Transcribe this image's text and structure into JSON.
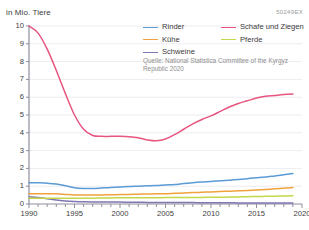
{
  "chart_data": {
    "type": "line",
    "title": "",
    "subtitle": "",
    "unit_label": "in Mio. Tiere",
    "xlabel": "",
    "ylabel": "in Mio. Tiere",
    "xlim": [
      1990,
      2020
    ],
    "ylim": [
      0,
      10
    ],
    "y_ticks": [
      "0",
      "1",
      "2",
      "3",
      "4",
      "5",
      "6",
      "7",
      "8",
      "9",
      "10"
    ],
    "x_ticks": [
      "1990",
      "1995",
      "2000",
      "2005",
      "2010",
      "2015",
      "2020"
    ],
    "x_minor_tick_step": 1,
    "grid": true,
    "legend_position": "top-right",
    "source_id": "50249EX",
    "source_note": "Quelle: National Statistica Committee of the Kyrgyz Republic 2020",
    "x": [
      1990,
      1991,
      1992,
      1993,
      1994,
      1995,
      1996,
      1997,
      1998,
      1999,
      2000,
      2001,
      2002,
      2003,
      2004,
      2005,
      2006,
      2007,
      2008,
      2009,
      2010,
      2011,
      2012,
      2013,
      2014,
      2015,
      2016,
      2017,
      2018,
      2019
    ],
    "series": [
      {
        "name": "Rinder",
        "color": "#5b9bd5",
        "values": [
          1.2,
          1.19,
          1.17,
          1.12,
          1.02,
          0.91,
          0.87,
          0.87,
          0.9,
          0.93,
          0.95,
          0.98,
          1.0,
          1.02,
          1.04,
          1.07,
          1.09,
          1.15,
          1.2,
          1.24,
          1.27,
          1.31,
          1.34,
          1.38,
          1.42,
          1.47,
          1.52,
          1.58,
          1.64,
          1.71
        ]
      },
      {
        "name": "Kühe",
        "color": "#f0a33c",
        "values": [
          0.58,
          0.58,
          0.58,
          0.57,
          0.54,
          0.51,
          0.5,
          0.5,
          0.51,
          0.52,
          0.53,
          0.54,
          0.55,
          0.56,
          0.57,
          0.58,
          0.6,
          0.62,
          0.64,
          0.66,
          0.68,
          0.7,
          0.72,
          0.74,
          0.76,
          0.79,
          0.82,
          0.85,
          0.88,
          0.92
        ]
      },
      {
        "name": "Schweine",
        "color": "#8076b0",
        "values": [
          0.4,
          0.36,
          0.3,
          0.22,
          0.17,
          0.14,
          0.12,
          0.11,
          0.11,
          0.11,
          0.11,
          0.1,
          0.1,
          0.09,
          0.09,
          0.09,
          0.08,
          0.08,
          0.08,
          0.07,
          0.07,
          0.07,
          0.07,
          0.06,
          0.06,
          0.06,
          0.06,
          0.06,
          0.06,
          0.06
        ]
      },
      {
        "name": "Schafe und Ziegen",
        "color": "#e8557f",
        "values": [
          10.0,
          9.6,
          8.7,
          7.5,
          6.2,
          5.0,
          4.2,
          3.85,
          3.8,
          3.8,
          3.8,
          3.78,
          3.72,
          3.6,
          3.55,
          3.65,
          3.9,
          4.2,
          4.5,
          4.75,
          4.95,
          5.2,
          5.45,
          5.65,
          5.8,
          5.95,
          6.05,
          6.1,
          6.15,
          6.18
        ]
      },
      {
        "name": "Pferde",
        "color": "#c4d84a",
        "values": [
          0.32,
          0.32,
          0.32,
          0.32,
          0.32,
          0.32,
          0.33,
          0.33,
          0.34,
          0.34,
          0.35,
          0.35,
          0.35,
          0.35,
          0.35,
          0.36,
          0.36,
          0.36,
          0.37,
          0.37,
          0.38,
          0.38,
          0.39,
          0.4,
          0.41,
          0.42,
          0.43,
          0.44,
          0.45,
          0.46
        ]
      }
    ]
  },
  "legend": {
    "rows": [
      [
        {
          "label": "Rinder",
          "color": "#5b9bd5"
        },
        {
          "label": "Schafe und Ziegen",
          "color": "#e8557f"
        }
      ],
      [
        {
          "label": "Kühe",
          "color": "#f0a33c"
        },
        {
          "label": "Pferde",
          "color": "#c4d84a"
        }
      ],
      [
        {
          "label": "Schweine",
          "color": "#8076b0"
        }
      ]
    ]
  }
}
